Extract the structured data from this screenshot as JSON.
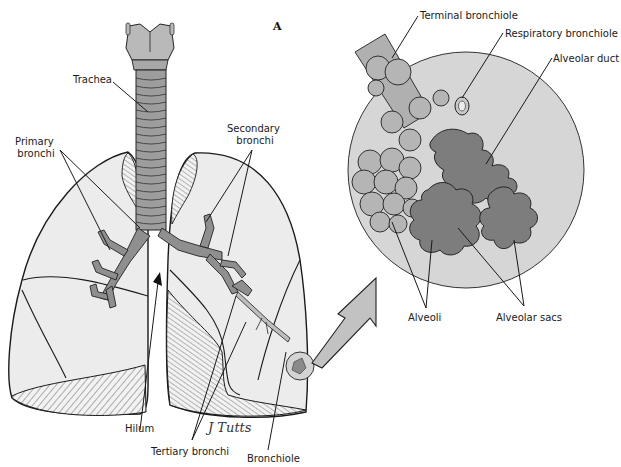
{
  "figure": {
    "panel_label": "A",
    "signature": "J Tutts",
    "colors": {
      "background": "#ffffff",
      "lung_fill": "#ececec",
      "inset_fill": "#d6d6d6",
      "airway_fill": "#9a9a9a",
      "alveolar_sac_fill": "#7d7d7d",
      "hatch_stroke": "#555555",
      "line": "#1a1a1a"
    }
  },
  "labels": {
    "trachea": "Trachea",
    "primary_bronchi_line1": "Primary",
    "primary_bronchi_line2": "bronchi",
    "secondary_bronchi_line1": "Secondary",
    "secondary_bronchi_line2": "bronchi",
    "hilum": "Hilum",
    "tertiary_bronchi": "Tertiary bronchi",
    "bronchiole": "Bronchiole",
    "terminal_bronchiole": "Terminal bronchiole",
    "respiratory_bronchiole": "Respiratory bronchiole",
    "alveolar_duct": "Alveolar duct",
    "alveoli": "Alveoli",
    "alveolar_sacs": "Alveolar sacs"
  }
}
